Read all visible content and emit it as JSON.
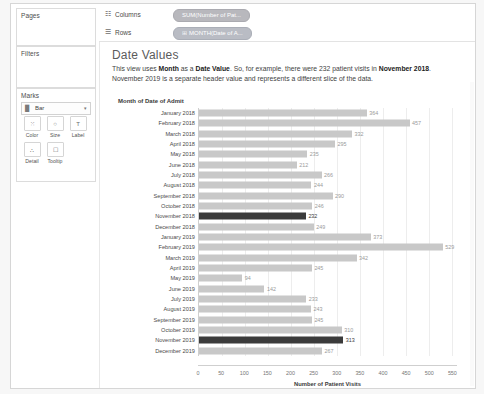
{
  "panels": {
    "pages": {
      "title": "Pages"
    },
    "filters": {
      "title": "Filters"
    },
    "marks": {
      "title": "Marks",
      "mark_type": "Bar",
      "mark_type_icon": "bar-icon",
      "caret": "▾",
      "buttons": [
        {
          "label": "Color",
          "icon": "color-icon",
          "glyph": "⁙"
        },
        {
          "label": "Size",
          "icon": "size-icon",
          "glyph": "○"
        },
        {
          "label": "Label",
          "icon": "label-icon",
          "glyph": "T"
        },
        {
          "label": "Detail",
          "icon": "detail-icon",
          "glyph": "∴"
        },
        {
          "label": "Tooltip",
          "icon": "tooltip-icon",
          "glyph": "☐"
        }
      ]
    }
  },
  "shelves": [
    {
      "name": "Columns",
      "icon": "columns-icon",
      "glyph": "☷",
      "pill": "SUM(Number of Pat...",
      "pill_icon": ""
    },
    {
      "name": "Rows",
      "icon": "rows-icon",
      "glyph": "☰",
      "pill": "MONTH(Date of A...",
      "pill_icon": "⊞"
    }
  ],
  "content": {
    "title": "Date Values",
    "description_parts": [
      {
        "text": "This view uses ",
        "bold": false
      },
      {
        "text": "Month",
        "bold": true
      },
      {
        "text": " as a ",
        "bold": false
      },
      {
        "text": "Date Value",
        "bold": true
      },
      {
        "text": ".  So, for example, there were 232 patient visits in ",
        "bold": false
      },
      {
        "text": "November 2018",
        "bold": true
      },
      {
        "text": ". November 2019 is a separate header value and represents a different slice of the data.",
        "bold": false
      }
    ]
  },
  "chart_data": {
    "type": "bar",
    "orientation": "horizontal",
    "title": "",
    "ylabel": "Month of Date of Admit",
    "xlabel": "Number of Patient Visits",
    "xlim": [
      0,
      560
    ],
    "xticks": [
      0,
      50,
      100,
      150,
      200,
      250,
      300,
      350,
      400,
      450,
      500,
      550
    ],
    "grid": true,
    "highlight_color": "#3b3b3b",
    "bar_color": "#c8c8c8",
    "categories": [
      "January 2018",
      "February 2018",
      "March 2018",
      "April 2018",
      "May 2018",
      "June 2018",
      "July 2018",
      "August 2018",
      "September 2018",
      "October 2018",
      "November 2018",
      "December 2018",
      "January 2019",
      "February 2019",
      "March 2019",
      "April 2019",
      "May 2019",
      "June 2019",
      "July 2019",
      "August 2019",
      "September 2019",
      "October 2019",
      "November 2019",
      "December 2019"
    ],
    "values": [
      364,
      457,
      332,
      295,
      235,
      212,
      266,
      244,
      290,
      246,
      232,
      249,
      373,
      529,
      342,
      245,
      94,
      142,
      233,
      243,
      245,
      310,
      313,
      267
    ],
    "labels": [
      "364",
      "457",
      "332",
      "295",
      "235",
      "212",
      "266",
      "244",
      "290",
      "246",
      "232",
      "249",
      "373",
      "529",
      "342",
      "245",
      "94",
      "142",
      "233",
      "243",
      "245",
      "310",
      "313",
      "267"
    ],
    "highlighted": [
      "November 2018",
      "November 2019"
    ]
  }
}
